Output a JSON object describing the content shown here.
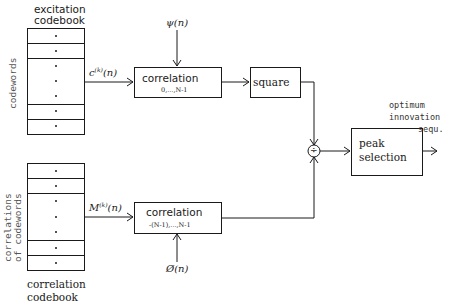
{
  "diagram": {
    "excitation_codebook": {
      "title_line1": "excitation",
      "title_line2": "codebook",
      "side_label": "codewords",
      "dot": "•"
    },
    "correlation_codebook": {
      "title_line1": "correlation",
      "title_line2": "codebook",
      "side_label_line1": "correlations",
      "side_label_line2": "of codewords",
      "dot": "•"
    },
    "signals": {
      "codeword": "c",
      "codeword_sup": "(k)",
      "codeword_arg": "(n)",
      "psi": "ψ(n)",
      "mu": "M",
      "mu_sup": "(k)",
      "mu_arg": "(n)",
      "phi": "Ø(n)"
    },
    "blocks": {
      "corr_top_label": "correlation",
      "corr_top_range": "0,...,N-1",
      "square_label": "square",
      "corr_bottom_label": "correlation",
      "corr_bottom_range": "-(N-1),...,N-1",
      "divider_symbol": "÷",
      "peak_line1": "peak",
      "peak_line2": "selection"
    },
    "output": {
      "line1": "optimum",
      "line2": "innovation",
      "line3": "sequ."
    }
  }
}
